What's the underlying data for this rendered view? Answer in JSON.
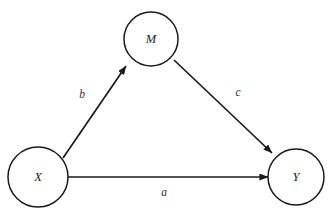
{
  "diagram": {
    "type": "mediation-path-diagram",
    "background_color": "#ffffff",
    "stroke_color": "#1a1a1a",
    "text_color": "#222222",
    "nodes": [
      {
        "id": "M",
        "label": "M",
        "cx": 151,
        "cy": 39,
        "r": 27
      },
      {
        "id": "X",
        "label": "X",
        "cx": 38,
        "cy": 177,
        "r": 30
      },
      {
        "id": "Y",
        "label": "Y",
        "cx": 296,
        "cy": 177,
        "r": 28
      }
    ],
    "edges": [
      {
        "id": "x-to-m",
        "label": "b",
        "from": "X",
        "to": "M",
        "label_x": 82,
        "label_y": 95,
        "x1": 63,
        "y1": 158,
        "x2": 128,
        "y2": 64
      },
      {
        "id": "m-to-y",
        "label": "c",
        "from": "M",
        "to": "Y",
        "label_x": 238,
        "label_y": 93,
        "x1": 174,
        "y1": 60,
        "x2": 274,
        "y2": 155
      },
      {
        "id": "x-to-y",
        "label": "a",
        "from": "X",
        "to": "Y",
        "label_x": 164,
        "label_y": 193,
        "x1": 68,
        "y1": 177,
        "x2": 270,
        "y2": 177
      }
    ]
  }
}
